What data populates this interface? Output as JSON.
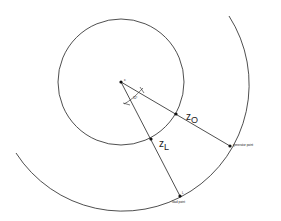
{
  "diagram": {
    "center_label": "c",
    "angle_label": "32°",
    "z0_label": {
      "main": "z",
      "sub": "O"
    },
    "zl_label": {
      "main": "z",
      "sub": "L"
    },
    "generator_label": "generator point",
    "load_label": "load point",
    "load_marker": "L",
    "colors": {
      "stroke": "#222222",
      "background": "#ffffff"
    },
    "geometry": {
      "center": [
        121,
        82
      ],
      "inner_radius": 63,
      "outer_radius": 126,
      "z0_point": [
        176,
        114
      ],
      "zl_point": [
        151,
        139
      ],
      "generator_point": [
        230,
        146
      ],
      "load_point": [
        180,
        196
      ]
    }
  }
}
